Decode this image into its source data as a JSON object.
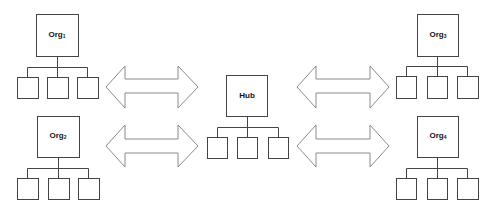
{
  "diagram": {
    "type": "hub-and-spoke organization network",
    "nodes": [
      {
        "id": "org1",
        "label": "Org",
        "subscript": "1",
        "children": 3
      },
      {
        "id": "org2",
        "label": "Org",
        "subscript": "2",
        "children": 3
      },
      {
        "id": "hub",
        "label": "Hub",
        "subscript": "",
        "children": 3
      },
      {
        "id": "org3",
        "label": "Org",
        "subscript": "3",
        "children": 3
      },
      {
        "id": "org4",
        "label": "Org",
        "subscript": "4",
        "children": 3
      }
    ],
    "connections": [
      {
        "from": "org1",
        "to": "hub",
        "style": "double-headed block arrow"
      },
      {
        "from": "org2",
        "to": "hub",
        "style": "double-headed block arrow"
      },
      {
        "from": "hub",
        "to": "org3",
        "style": "double-headed block arrow"
      },
      {
        "from": "hub",
        "to": "org4",
        "style": "double-headed block arrow"
      }
    ],
    "colors": {
      "stroke": "#444444",
      "arrow_stroke": "#8a8a8a",
      "background": "#ffffff"
    }
  }
}
